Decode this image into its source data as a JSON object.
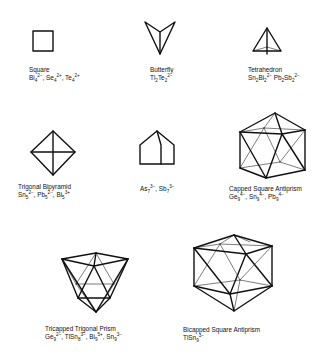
{
  "figure": {
    "clusters": [
      {
        "id": "square",
        "name": "Square",
        "species": [
          {
            "el": "Bi",
            "n": "4",
            "charge": "2−"
          },
          {
            "el": "Se",
            "n": "4",
            "charge": "2+"
          },
          {
            "el": "Te",
            "n": "4",
            "charge": "2+"
          }
        ]
      },
      {
        "id": "butterfly",
        "name": "Butterfly",
        "species": [
          {
            "formula": [
              {
                "el": "Tl",
                "n": "2"
              },
              {
                "el": "Te",
                "n": "2"
              }
            ],
            "charge": "2−"
          }
        ]
      },
      {
        "id": "tetrahedron",
        "name": "Tetrahedron",
        "species": [
          {
            "formula": [
              {
                "el": "Sn",
                "n": "2"
              },
              {
                "el": "Bi",
                "n": "2"
              }
            ],
            "charge": "2−"
          },
          {
            "formula": [
              {
                "el": "Pb",
                "n": "2"
              },
              {
                "el": "Sb",
                "n": "2"
              }
            ],
            "charge": "2−"
          }
        ]
      },
      {
        "id": "trigonal-bipyramid",
        "name": "Trigonal Bipyramid",
        "species": [
          {
            "el": "Sn",
            "n": "5",
            "charge": "2−"
          },
          {
            "el": "Pb",
            "n": "5",
            "charge": "2−"
          },
          {
            "el": "Bi",
            "n": "5",
            "charge": "3+"
          }
        ]
      },
      {
        "id": "nortricyclane",
        "name": "",
        "species": [
          {
            "el": "As",
            "n": "7",
            "charge": "3−"
          },
          {
            "el": "Sb",
            "n": "7",
            "charge": "3−"
          }
        ]
      },
      {
        "id": "capped-square-antiprism",
        "name": "Capped Square Antiprism",
        "species": [
          {
            "el": "Ge",
            "n": "9",
            "charge": "4−"
          },
          {
            "el": "Sn",
            "n": "9",
            "charge": "4−"
          },
          {
            "el": "Pb",
            "n": "9",
            "charge": "4−"
          }
        ]
      },
      {
        "id": "tricapped-trigonal-prism",
        "name": "Tricapped Trigonal Prism",
        "species": [
          {
            "el": "Ge",
            "n": "9",
            "charge": "2−"
          },
          {
            "formula": [
              {
                "el": "TlSn",
                "n": "8"
              }
            ],
            "charge": "3−"
          },
          {
            "el": "Bi",
            "n": "9",
            "charge": "5+"
          },
          {
            "el": "Sn",
            "n": "9",
            "charge": "3−"
          }
        ]
      },
      {
        "id": "bicapped-square-antiprism",
        "name": "Bicapped Square Antiprism",
        "species": [
          {
            "formula": [
              {
                "el": "TlSn",
                "n": "9"
              }
            ],
            "charge": "3−"
          }
        ]
      }
    ],
    "text": {
      "square_name": "Square",
      "square_formula": "Bi₄²⁻, Se₄²⁺, Te₄²⁺",
      "butterfly_name": "Butterfly",
      "butterfly_formula": "Tl₂Te₂²⁻",
      "tetrahedron_name": "Tetrahedron",
      "tetrahedron_formula": "Sn₂Bi₂²⁻ Pb₂Sb₂²⁻",
      "tbp_name": "Trigonal Bipyramid",
      "tbp_formula": "Sn₅²⁻, Pb₅²⁻, Bi₅³⁺",
      "x7_formula": "As₇³⁻, Sb₇³⁻",
      "csa_name": "Capped Square Antiprism",
      "csa_formula": "Ge₉⁴⁻, Sn₉⁴⁻, Pb₉⁴⁻",
      "ttp_name": "Tricapped Trigonal Prism",
      "ttp_formula": "Ge₉²⁻, TlSn₈³⁻, Bi₉⁵⁺, Sn₉³⁻",
      "bsa_name": "Bicapped Square Antiprism",
      "bsa_formula": "TlSn₉³⁻"
    },
    "colors": {
      "line": "#111111",
      "background": "#ffffff"
    }
  }
}
